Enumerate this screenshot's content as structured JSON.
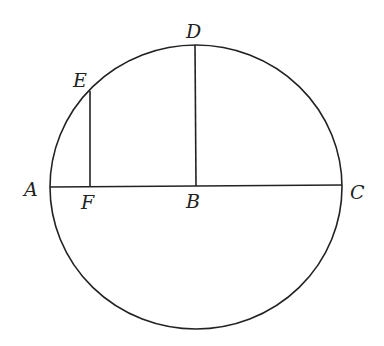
{
  "diagram": {
    "type": "circle-geometry",
    "stroke_color": "#222222",
    "background": "#ffffff",
    "circle": {
      "cx": 196,
      "cy": 187,
      "rx": 146,
      "ry": 142
    },
    "points": {
      "A": {
        "label": "A",
        "x": 50,
        "y": 187
      },
      "B": {
        "label": "B",
        "x": 196,
        "y": 186
      },
      "C": {
        "label": "C",
        "x": 342,
        "y": 185
      },
      "D": {
        "label": "D",
        "x": 195,
        "y": 45
      },
      "E": {
        "label": "E",
        "x": 90,
        "y": 90
      },
      "F": {
        "label": "F",
        "x": 90,
        "y": 186
      }
    },
    "segments": [
      {
        "name": "AC",
        "from": "A",
        "to": "C"
      },
      {
        "name": "BD",
        "from": "B",
        "to": "D"
      },
      {
        "name": "EF",
        "from": "E",
        "to": "F"
      }
    ]
  }
}
